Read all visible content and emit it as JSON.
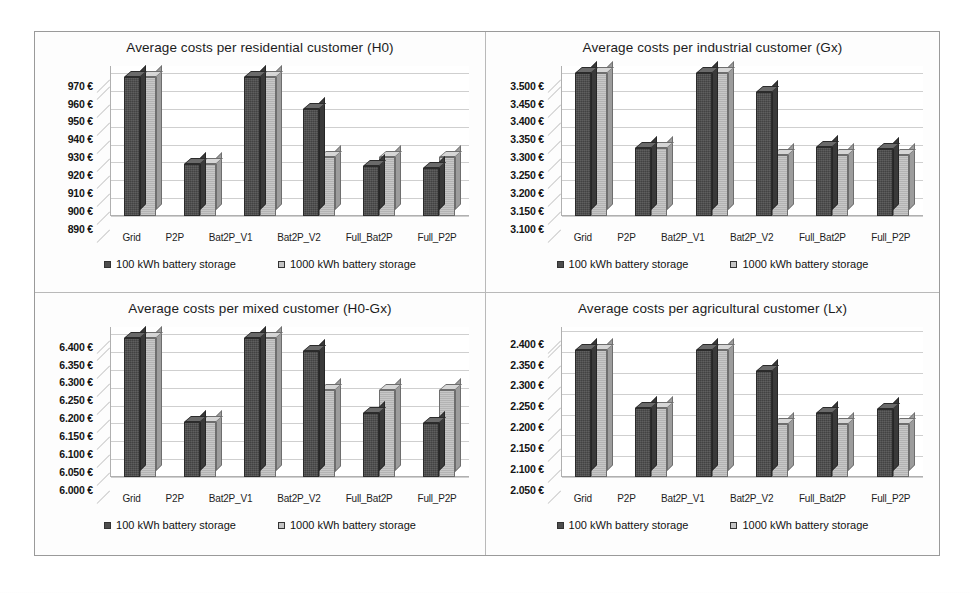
{
  "legend": {
    "series": [
      {
        "label": "100 kWh battery storage",
        "swatch": "dark",
        "color": "#4d4d4d"
      },
      {
        "label": "1000 kWh battery storage",
        "swatch": "light",
        "color": "#c4c4c4"
      }
    ]
  },
  "categories": [
    "Grid",
    "P2P",
    "Bat2P_V1",
    "Bat2P_V2",
    "Full_Bat2P",
    "Full_P2P"
  ],
  "panels": [
    {
      "id": "residential",
      "title": "Average costs per residential customer (H0)",
      "ytick_labels": [
        "970 €",
        "960 €",
        "950 €",
        "940 €",
        "930 €",
        "920 €",
        "910 €",
        "900 €",
        "890 €"
      ]
    },
    {
      "id": "industrial",
      "title": "Average costs per industrial customer (Gx)",
      "ytick_labels": [
        "3.500 €",
        "3.450 €",
        "3.400 €",
        "3.350 €",
        "3.300 €",
        "3.250 €",
        "3.200 €",
        "3.150 €",
        "3.100 €"
      ]
    },
    {
      "id": "mixed",
      "title": "Average costs per mixed customer (H0-Gx)",
      "ytick_labels": [
        "6.400 €",
        "6.350 €",
        "6.300 €",
        "6.250 €",
        "6.200 €",
        "6.150 €",
        "6.100 €",
        "6.050 €",
        "6.000 €"
      ]
    },
    {
      "id": "agricultural",
      "title": "Average costs per agricultural customer (Lx)",
      "ytick_labels": [
        "2.400 €",
        "2.350 €",
        "2.300 €",
        "2.250 €",
        "2.200 €",
        "2.150 €",
        "2.100 €",
        "2.050 €"
      ]
    }
  ],
  "chart_data": [
    {
      "type": "bar",
      "title": "Average costs per residential customer (H0)",
      "xlabel": "",
      "ylabel": "",
      "ylim": [
        890,
        974
      ],
      "ytick_values": [
        970,
        960,
        950,
        940,
        930,
        920,
        910,
        900,
        890
      ],
      "ytick_labels": [
        "970 €",
        "960 €",
        "950 €",
        "940 €",
        "930 €",
        "920 €",
        "910 €",
        "900 €",
        "890 €"
      ],
      "categories": [
        "Grid",
        "P2P",
        "Bat2P_V1",
        "Bat2P_V2",
        "Full_Bat2P",
        "Full_P2P"
      ],
      "series": [
        {
          "name": "100 kWh battery storage",
          "values": [
            968,
            919,
            968,
            950,
            918,
            917
          ]
        },
        {
          "name": "1000 kWh battery storage",
          "values": [
            968,
            919,
            968,
            923,
            923,
            923
          ]
        }
      ],
      "grid": true,
      "legend_position": "bottom"
    },
    {
      "type": "bar",
      "title": "Average costs per industrial customer (Gx)",
      "xlabel": "",
      "ylabel": "",
      "ylim": [
        3100,
        3520
      ],
      "ytick_values": [
        3500,
        3450,
        3400,
        3350,
        3300,
        3250,
        3200,
        3150,
        3100
      ],
      "ytick_labels": [
        "3.500 €",
        "3.450 €",
        "3.400 €",
        "3.350 €",
        "3.300 €",
        "3.250 €",
        "3.200 €",
        "3.150 €",
        "3.100 €"
      ],
      "categories": [
        "Grid",
        "P2P",
        "Bat2P_V1",
        "Bat2P_V2",
        "Full_Bat2P",
        "Full_P2P"
      ],
      "series": [
        {
          "name": "100 kWh battery storage",
          "values": [
            3500,
            3290,
            3500,
            3447,
            3292,
            3288
          ]
        },
        {
          "name": "1000 kWh battery storage",
          "values": [
            3500,
            3290,
            3500,
            3272,
            3270,
            3270
          ]
        }
      ],
      "grid": true,
      "legend_position": "bottom"
    },
    {
      "type": "bar",
      "title": "Average costs per mixed customer (H0-Gx)",
      "xlabel": "",
      "ylabel": "",
      "ylim": [
        6000,
        6420
      ],
      "ytick_values": [
        6400,
        6350,
        6300,
        6250,
        6200,
        6150,
        6100,
        6050,
        6000
      ],
      "ytick_labels": [
        "6.400 €",
        "6.350 €",
        "6.300 €",
        "6.250 €",
        "6.200 €",
        "6.150 €",
        "6.100 €",
        "6.050 €",
        "6.000 €"
      ],
      "categories": [
        "Grid",
        "P2P",
        "Bat2P_V1",
        "Bat2P_V2",
        "Full_Bat2P",
        "Full_P2P"
      ],
      "series": [
        {
          "name": "100 kWh battery storage",
          "values": [
            6388,
            6155,
            6388,
            6352,
            6178,
            6152
          ]
        },
        {
          "name": "1000 kWh battery storage",
          "values": [
            6388,
            6155,
            6388,
            6245,
            6243,
            6245
          ]
        }
      ],
      "grid": true,
      "legend_position": "bottom"
    },
    {
      "type": "bar",
      "title": "Average costs per agricultural customer (Lx)",
      "xlabel": "",
      "ylabel": "",
      "ylim": [
        2050,
        2410
      ],
      "ytick_values": [
        2400,
        2350,
        2300,
        2250,
        2200,
        2150,
        2100,
        2050
      ],
      "ytick_labels": [
        "2.400 €",
        "2.350 €",
        "2.300 €",
        "2.250 €",
        "2.200 €",
        "2.150 €",
        "2.100 €",
        "2.050 €"
      ],
      "categories": [
        "Grid",
        "P2P",
        "Bat2P_V1",
        "Bat2P_V2",
        "Full_Bat2P",
        "Full_P2P"
      ],
      "series": [
        {
          "name": "100 kWh battery storage",
          "values": [
            2355,
            2215,
            2355,
            2305,
            2203,
            2213
          ]
        },
        {
          "name": "1000 kWh battery storage",
          "values": [
            2355,
            2215,
            2355,
            2178,
            2178,
            2178
          ]
        }
      ],
      "grid": true,
      "legend_position": "bottom"
    }
  ]
}
